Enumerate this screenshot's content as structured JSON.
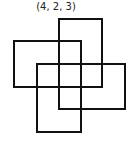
{
  "label": "(4, 2, 3)",
  "stroke_color": "#111111",
  "rectangles": [
    {
      "name": "top",
      "x": 59,
      "y": 19,
      "w": 43,
      "h": 68
    },
    {
      "name": "left",
      "x": 14,
      "y": 41,
      "w": 67,
      "h": 46
    },
    {
      "name": "right",
      "x": 59,
      "y": 64,
      "w": 66,
      "h": 45
    },
    {
      "name": "bottom",
      "x": 37,
      "y": 64,
      "w": 44,
      "h": 68
    }
  ]
}
